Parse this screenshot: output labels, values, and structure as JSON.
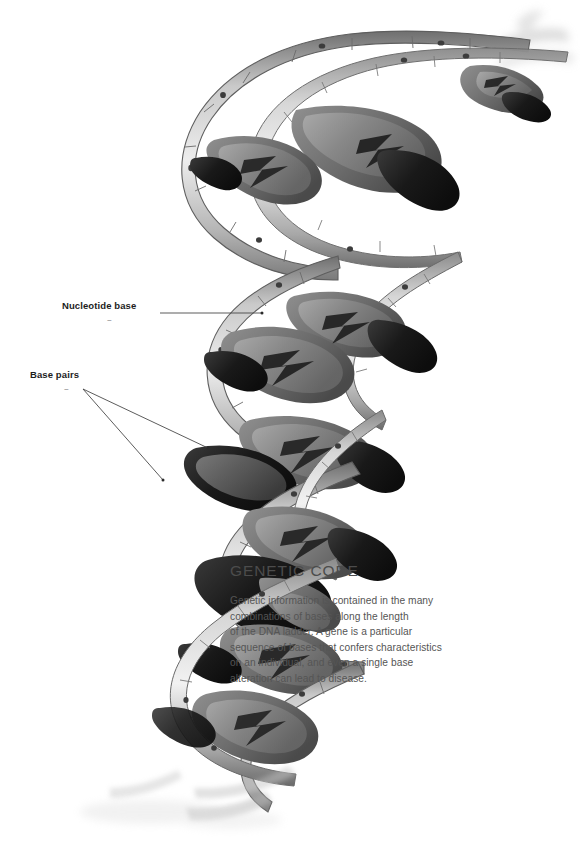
{
  "figure": {
    "style": "grayscale-airbrush-illustration",
    "background_color": "#ffffff"
  },
  "callouts": [
    {
      "id": "nucleotide-base",
      "label": "Nucleotide base",
      "tilde": "~",
      "leader_lines": 1
    },
    {
      "id": "base-pairs",
      "label": "Base pairs",
      "tilde": "~",
      "leader_lines": 2
    }
  ],
  "panel": {
    "heading": "GENETIC CODE",
    "body_lines": [
      "Genetic information is contained in the many",
      "combinations of bases along the length",
      "of the DNA ladder. A gene is a particular",
      "sequence of bases that confers characteristics",
      "on an individual, and even a single base",
      "alteration can lead to disease."
    ]
  },
  "colors": {
    "background": "#ffffff",
    "label_text": "#1d1d1d",
    "heading_text": "#4c4c4c",
    "body_text": "#555555",
    "leader_line": "#4a4a4a",
    "backbone_light": "#d8d8d8",
    "backbone_mid": "#a8a8a8",
    "backbone_dark": "#6f6f6f",
    "base_light": "#9a9a9a",
    "base_mid": "#6e6e6e",
    "base_dark": "#1a1a1a",
    "node_dot": "#3c3c3c"
  }
}
